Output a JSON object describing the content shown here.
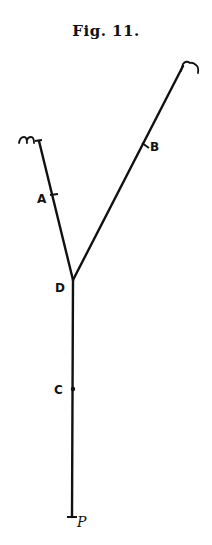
{
  "figure": {
    "title": "Fig. 11."
  },
  "diagram": {
    "stroke_color": "#111111",
    "background": "#ffffff",
    "vertex": {
      "name": "D",
      "x": 73,
      "y": 280
    },
    "arms": [
      {
        "name": "left-arm",
        "from": "D",
        "to_end_label": "m",
        "end": {
          "x": 39,
          "y": 141
        }
      },
      {
        "name": "right-arm",
        "from": "D",
        "to_end_label": "n",
        "end": {
          "x": 183,
          "y": 66
        }
      },
      {
        "name": "stem",
        "from": "D",
        "to_end_label": "P",
        "end": {
          "x": 72,
          "y": 517
        }
      }
    ],
    "points": [
      {
        "label": "A",
        "x": 53,
        "y": 196
      },
      {
        "label": "B",
        "x": 145,
        "y": 145
      },
      {
        "label": "C",
        "x": 73,
        "y": 389
      },
      {
        "label": "D",
        "x": 73,
        "y": 280
      }
    ],
    "end_labels": {
      "left_top": "m",
      "right_top": "n",
      "bottom": "P"
    },
    "labels": {
      "A": "A",
      "B": "B",
      "C": "C",
      "D": "D"
    }
  }
}
